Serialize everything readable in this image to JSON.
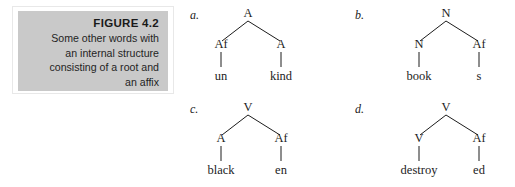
{
  "figure": {
    "number_label": "FIGURE 4.2",
    "caption_lines": [
      "Some other words with",
      "an internal structure",
      "consisting of a root and",
      "an affix"
    ],
    "panel_color": "#c9c9c9",
    "frame_color": "#e8e8e8",
    "background_color": "#ffffff",
    "ink_color": "#1c1c1c"
  },
  "trees": [
    {
      "label": "a.",
      "root": "A",
      "children": [
        {
          "category": "Af",
          "word": "un"
        },
        {
          "category": "A",
          "word": "kind"
        }
      ]
    },
    {
      "label": "b.",
      "root": "N",
      "children": [
        {
          "category": "N",
          "word": "book"
        },
        {
          "category": "Af",
          "word": "s"
        }
      ]
    },
    {
      "label": "c.",
      "root": "V",
      "children": [
        {
          "category": "A",
          "word": "black"
        },
        {
          "category": "Af",
          "word": "en"
        }
      ]
    },
    {
      "label": "d.",
      "root": "V",
      "children": [
        {
          "category": "V",
          "word": "destroy"
        },
        {
          "category": "Af",
          "word": "ed"
        }
      ]
    }
  ]
}
